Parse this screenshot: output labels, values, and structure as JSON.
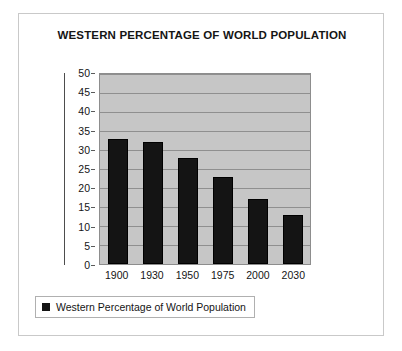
{
  "chart_data": {
    "type": "bar",
    "title": "WESTERN PERCENTAGE OF WORLD POPULATION",
    "categories": [
      "1900",
      "1930",
      "1950",
      "1975",
      "2000",
      "2030"
    ],
    "values": [
      33,
      32,
      28,
      23,
      17,
      13
    ],
    "series": [
      {
        "name": "Western Percentage of World Population",
        "values": [
          33,
          32,
          28,
          23,
          17,
          13
        ],
        "color": "#141414"
      }
    ],
    "xlabel": "Year",
    "ylabel": "",
    "ylim": [
      0,
      50
    ],
    "ytick_step": 5,
    "yticks": [
      0,
      5,
      10,
      15,
      20,
      25,
      30,
      35,
      40,
      45,
      50
    ],
    "ytick_labels": [
      "0",
      "5",
      "10",
      "15",
      "20",
      "25",
      "30",
      "35",
      "40",
      "45",
      "50"
    ],
    "grid": true,
    "grid_axis": "y",
    "legend": {
      "position": "bottom-left",
      "entries": [
        "Western Percentage of World Population"
      ],
      "marker": "filled-square"
    },
    "plot_background": "#c6c6c6",
    "gridline_color": "#8f8f8f",
    "frame_border_color": "#c9c9c9"
  }
}
